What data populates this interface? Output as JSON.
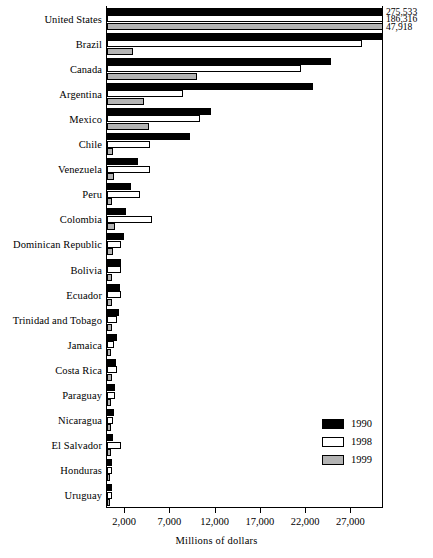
{
  "chart_data": {
    "type": "bar",
    "orientation": "horizontal",
    "title": "",
    "xlabel": "Millions of dollars",
    "ylabel": "",
    "xlim": [
      0,
      30600
    ],
    "xticks": [
      2000,
      7000,
      12000,
      17000,
      22000,
      27000
    ],
    "xtick_labels": [
      "2,000",
      "7,000",
      "12,000",
      "17,000",
      "22,000",
      "27,000"
    ],
    "grid": false,
    "legend_position": "inside-bottom-right",
    "categories": [
      "United States",
      "Brazil",
      "Canada",
      "Argentina",
      "Mexico",
      "Chile",
      "Venezuela",
      "Peru",
      "Colombia",
      "Dominican Republic",
      "Bolivia",
      "Ecuador",
      "Trinidad and Tobago",
      "Jamaica",
      "Costa Rica",
      "Paraguay",
      "Nicaragua",
      "El Salvador",
      "Honduras",
      "Uruguay"
    ],
    "series": [
      {
        "name": "1990",
        "color": "#000000",
        "values": [
          275533,
          30500,
          24700,
          22800,
          11500,
          9200,
          3400,
          2600,
          2100,
          1900,
          1600,
          1400,
          1300,
          1100,
          1000,
          900,
          800,
          700,
          600,
          500
        ]
      },
      {
        "name": "1998",
        "color": "#ffffff",
        "values": [
          186316,
          28200,
          21400,
          8400,
          10300,
          4800,
          4700,
          3700,
          5000,
          1500,
          1500,
          1500,
          1100,
          800,
          1100,
          900,
          700,
          1600,
          500,
          500
        ]
      },
      {
        "name": "1999",
        "color": "#b3b3b3",
        "values": [
          47918,
          2900,
          9900,
          4100,
          4600,
          700,
          800,
          500,
          900,
          700,
          500,
          500,
          500,
          400,
          500,
          400,
          400,
          400,
          300,
          300
        ]
      }
    ],
    "overflow_labels": [
      {
        "value": "275,533",
        "series": "1990",
        "category": "United States"
      },
      {
        "value": "186,316",
        "series": "1998",
        "category": "United States"
      },
      {
        "value": "47,918",
        "series": "1999",
        "category": "United States"
      }
    ]
  },
  "legend": {
    "items": [
      {
        "label": "1990",
        "swatch": "y1990"
      },
      {
        "label": "1998",
        "swatch": "y1998"
      },
      {
        "label": "1999",
        "swatch": "y1999"
      }
    ]
  },
  "axis": {
    "x_title": "Millions of dollars"
  }
}
